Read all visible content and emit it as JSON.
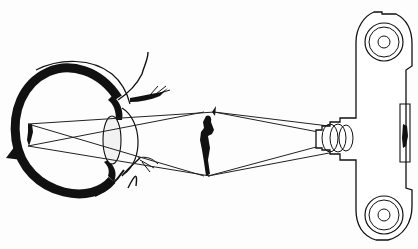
{
  "diagram": {
    "type": "comparison-illustration",
    "colors": {
      "ink": "#111111",
      "background": "#fdfdfd"
    },
    "components": [
      {
        "name": "eye",
        "parts": [
          "sclera",
          "cornea",
          "lens",
          "iris",
          "eyelid-upper",
          "eyelid-lower",
          "retina-image"
        ]
      },
      {
        "name": "object-figure",
        "description": "Standing human silhouette between eye and camera"
      },
      {
        "name": "camera",
        "parts": [
          "camera-body",
          "lens-barrel",
          "lens-elements",
          "film-plane-image",
          "film-spool-top",
          "film-spool-bottom"
        ]
      }
    ],
    "rays": [
      "object to eye lens, crossing and forming inverted image on retina",
      "object to camera lens, crossing and forming inverted image on film plane"
    ],
    "labels": []
  }
}
